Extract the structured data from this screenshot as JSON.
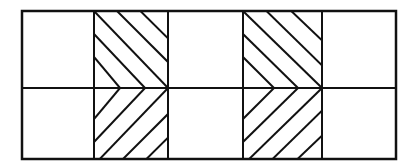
{
  "figure": {
    "rows": 2,
    "columns": 5,
    "hatched_columns": [
      2,
      4
    ],
    "hatch_pattern": "chevron-right",
    "line_color": "#111111",
    "background_color": "#ffffff",
    "cells": [
      {
        "row": 1,
        "col": 1,
        "fill": "empty"
      },
      {
        "row": 1,
        "col": 2,
        "fill": "hatch-down-right"
      },
      {
        "row": 1,
        "col": 3,
        "fill": "empty"
      },
      {
        "row": 1,
        "col": 4,
        "fill": "hatch-down-right"
      },
      {
        "row": 1,
        "col": 5,
        "fill": "empty"
      },
      {
        "row": 2,
        "col": 1,
        "fill": "empty"
      },
      {
        "row": 2,
        "col": 2,
        "fill": "hatch-up-right"
      },
      {
        "row": 2,
        "col": 3,
        "fill": "empty"
      },
      {
        "row": 2,
        "col": 4,
        "fill": "hatch-up-right"
      },
      {
        "row": 2,
        "col": 5,
        "fill": "empty"
      }
    ]
  }
}
